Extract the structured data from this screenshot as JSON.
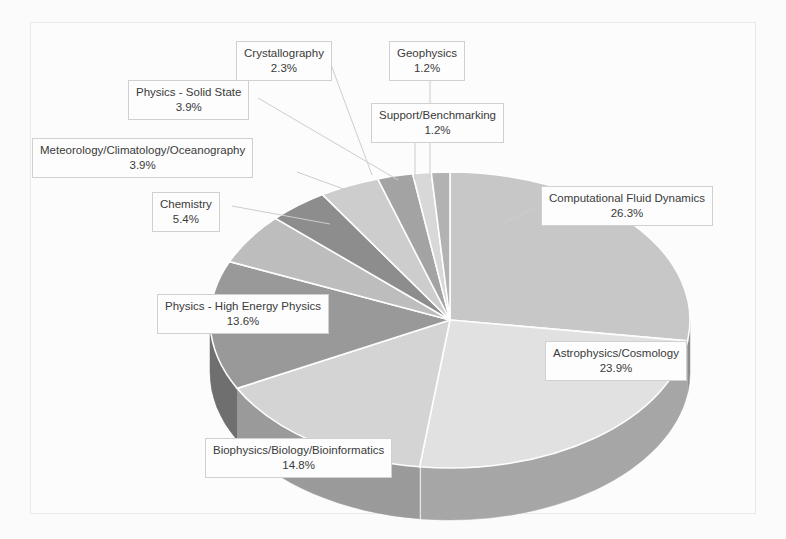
{
  "chart_data": {
    "type": "pie",
    "title": "",
    "subtitle": "",
    "xlabel": "",
    "ylabel": "",
    "legend_position": "none",
    "grid": false,
    "style": "3d-exploded-labels",
    "units": "percent",
    "categories": [
      "Computational Fluid Dynamics",
      "Astrophysics/Cosmology",
      "Biophysics/Biology/Bioinformatics",
      "Physics - High Energy Physics",
      "Chemistry",
      "Meteorology/Climatology/Oceanography",
      "Physics - Solid State",
      "Crystallography",
      "Support/Benchmarking",
      "Geophysics"
    ],
    "values": [
      26.3,
      23.9,
      14.8,
      13.6,
      5.4,
      3.9,
      3.9,
      2.3,
      1.2,
      1.2
    ],
    "value_labels": [
      "26.3%",
      "23.9%",
      "14.8%",
      "13.6%",
      "5.4%",
      "3.9%",
      "3.9%",
      "2.3%",
      "1.2%",
      "1.2%"
    ],
    "slice_colors": [
      "#c9c9c9",
      "#e3e3e3",
      "#d6d6d6",
      "#9a9a9a",
      "#bfbfbf",
      "#8e8e8e",
      "#cfcfcf",
      "#a5a5a5",
      "#dadada",
      "#b4b4b4"
    ],
    "side_colors": [
      "#8f8f8f",
      "#a8a8a8",
      "#9c9c9c",
      "#707070",
      "#8a8a8a",
      "#666666",
      "#969696",
      "#777777",
      "#a0a0a0",
      "#828282"
    ]
  },
  "colors": {
    "frame_border": "#ececec",
    "callout_border": "#d2d2d2",
    "callout_background": "#ffffff",
    "text": "#3b3b3b",
    "leader_line": "#cfcfcf",
    "page_background": "#fdfdfd"
  },
  "callouts": {
    "cfd": {
      "title": "Computational Fluid Dynamics",
      "percent": "26.3%"
    },
    "astro": {
      "title": "Astrophysics/Cosmology",
      "percent": "23.9%"
    },
    "biophys": {
      "title": "Biophysics/Biology/Bioinformatics",
      "percent": "14.8%"
    },
    "hep": {
      "title": "Physics - High Energy Physics",
      "percent": "13.6%"
    },
    "chemistry": {
      "title": "Chemistry",
      "percent": "5.4%"
    },
    "meteorology": {
      "title": "Meteorology/Climatology/Oceanography",
      "percent": "3.9%"
    },
    "solidstate": {
      "title": "Physics - Solid State",
      "percent": "3.9%"
    },
    "crystallography": {
      "title": "Crystallography",
      "percent": "2.3%"
    },
    "support": {
      "title": "Support/Benchmarking",
      "percent": "1.2%"
    },
    "geophysics": {
      "title": "Geophysics",
      "percent": "1.2%"
    }
  }
}
